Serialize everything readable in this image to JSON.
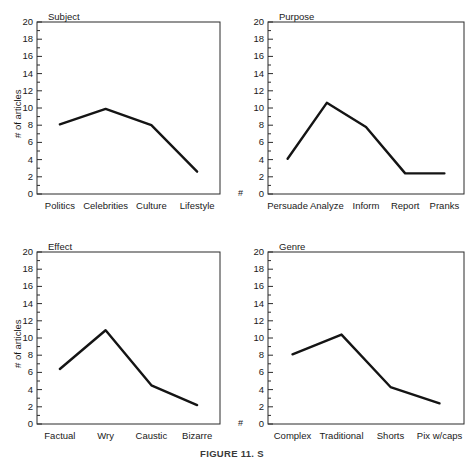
{
  "figure": {
    "caption": "FIGURE 11. S",
    "axis_label": "# of articles",
    "axis_label_short": "#",
    "y_ticks": [
      "0",
      "2",
      "4",
      "6",
      "8",
      "10",
      "12",
      "14",
      "16",
      "18",
      "20"
    ]
  },
  "chart_data": [
    {
      "type": "line",
      "title": "Subject",
      "xlabel": "",
      "ylabel": "# of articles",
      "ylim": [
        0,
        20
      ],
      "grid": false,
      "legend": "none",
      "categories": [
        "Politics",
        "Celebrities",
        "Culture",
        "Lifestyle"
      ],
      "values": [
        8.1,
        9.9,
        8.0,
        2.6
      ]
    },
    {
      "type": "line",
      "title": "Purpose",
      "xlabel": "",
      "ylabel": "#",
      "ylim": [
        0,
        20
      ],
      "grid": false,
      "legend": "none",
      "categories": [
        "Persuade",
        "Analyze",
        "Inform",
        "Report",
        "Pranks"
      ],
      "values": [
        4.1,
        10.6,
        7.8,
        2.4,
        2.4
      ]
    },
    {
      "type": "line",
      "title": "Effect",
      "xlabel": "",
      "ylabel": "# of articles",
      "ylim": [
        0,
        20
      ],
      "grid": false,
      "legend": "none",
      "categories": [
        "Factual",
        "Wry",
        "Caustic",
        "Bizarre"
      ],
      "values": [
        6.4,
        10.9,
        4.5,
        2.2
      ]
    },
    {
      "type": "line",
      "title": "Genre",
      "xlabel": "",
      "ylabel": "#",
      "ylim": [
        0,
        20
      ],
      "grid": false,
      "legend": "none",
      "categories": [
        "Complex",
        "Traditional",
        "Shorts",
        "Pix w/caps"
      ],
      "values": [
        8.1,
        10.4,
        4.3,
        2.4
      ]
    }
  ],
  "colors": {
    "line": "#141414",
    "axis": "#2b2b2b",
    "text": "#1a1a1a",
    "background": "#ffffff"
  }
}
